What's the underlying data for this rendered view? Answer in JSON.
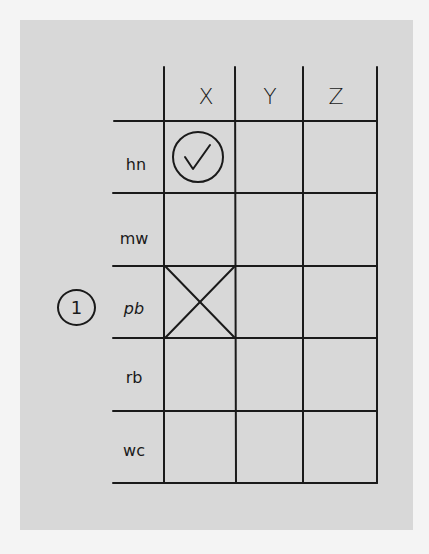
{
  "grid": {
    "columns": [
      {
        "label": "X"
      },
      {
        "label": "Y"
      },
      {
        "label": "Z"
      }
    ],
    "rows": [
      {
        "label": "hn",
        "cells": [
          "check-circle",
          "",
          ""
        ]
      },
      {
        "label": "mw",
        "cells": [
          "",
          "",
          ""
        ]
      },
      {
        "label": "pb",
        "cells": [
          "cross",
          "",
          ""
        ]
      },
      {
        "label": "rb",
        "cells": [
          "",
          "",
          ""
        ]
      },
      {
        "label": "wc",
        "cells": [
          "",
          "",
          ""
        ]
      }
    ]
  },
  "annotation": {
    "number": "1",
    "row": "pb"
  },
  "colors": {
    "background": "#d8d8d8",
    "border": "#f4f4f4",
    "ink": "#1a1a1a"
  }
}
